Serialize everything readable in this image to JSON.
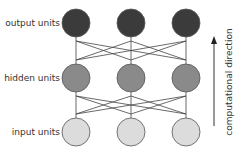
{
  "diagram": {
    "layers": [
      {
        "name": "output",
        "label": "output units",
        "fill": "#3b3b3b",
        "y": 23
      },
      {
        "name": "hidden",
        "label": "hidden units",
        "fill": "#8a8a8a",
        "y": 78
      },
      {
        "name": "input",
        "label": "input units",
        "fill": "#dcdcdc",
        "y": 132
      }
    ],
    "columns_x": [
      76,
      131,
      186
    ],
    "unit_radius": 14,
    "direction_label": "computational direction",
    "edge_color": "#444444"
  }
}
